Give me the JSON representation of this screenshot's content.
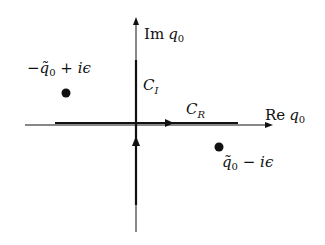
{
  "diagram": {
    "axes": {
      "real_label": {
        "prefix": "Re",
        "var": "q",
        "sub": "0"
      },
      "imag_label": {
        "prefix": "Im",
        "var": "q",
        "sub": "0"
      }
    },
    "contours": [
      {
        "name": "C_R",
        "label": "C",
        "sub": "R",
        "direction": "right"
      },
      {
        "name": "C_I",
        "label": "C",
        "sub": "I",
        "direction": "up"
      }
    ],
    "poles": [
      {
        "name": "upper-left-pole",
        "label": "−q̃₀ + iϵ",
        "parts": {
          "sign": "−",
          "var": "q̃",
          "sub": "0",
          "rest": " + iϵ"
        }
      },
      {
        "name": "lower-right-pole",
        "label": "q̃₀ − iϵ",
        "parts": {
          "sign": "",
          "var": "q̃",
          "sub": "0",
          "rest": " − iϵ"
        }
      }
    ],
    "colors": {
      "ink": "#111111",
      "background": "#ffffff"
    }
  }
}
